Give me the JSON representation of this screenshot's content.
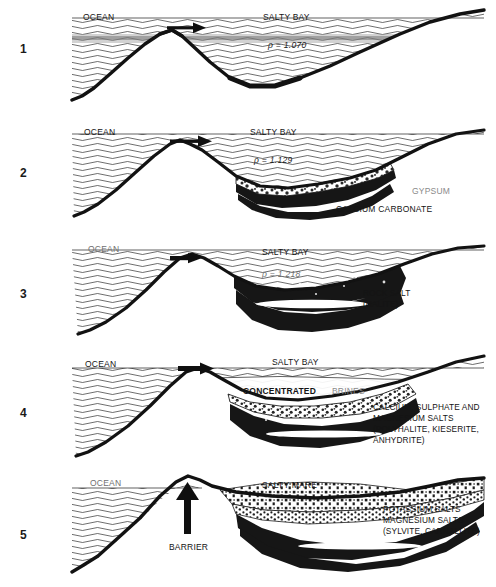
{
  "figure": {
    "title_alt": "Stages of evaporite deposition in a restricted salty bay",
    "caption_partial": ""
  },
  "panels": [
    {
      "number": "1",
      "ocean_label": "OCEAN",
      "basin_label": "SALTY BAY",
      "density_label": "ρ = 1.070",
      "deposit_labels": [],
      "arrow": "flow-arrow-right",
      "barrier_label": null
    },
    {
      "number": "2",
      "ocean_label": "OCEAN",
      "basin_label": "SALTY BAY",
      "density_label": "ρ = 1.129",
      "deposit_labels": [
        {
          "text": "GYPSUM",
          "tone": "gray"
        },
        {
          "text": "CALCIUM  CARBONATE",
          "tone": "dark"
        }
      ],
      "arrow": "flow-arrow-right",
      "barrier_label": null
    },
    {
      "number": "3",
      "ocean_label": "OCEAN",
      "basin_label": "SALTY BAY",
      "density_label": "ρ = 1.218",
      "deposit_labels": [
        {
          "text": "ROCK SALT\n(HALITE)",
          "tone": "dark"
        }
      ],
      "arrow": "flow-arrow-right",
      "barrier_label": null
    },
    {
      "number": "4",
      "ocean_label": "OCEAN",
      "basin_label": "SALTY BAY",
      "density_label": null,
      "brine_label_dark": "CONCENTRATED",
      "brine_label_gray": "BRINES",
      "deposit_labels": [
        {
          "text": "CALCIUM, SULPHATE AND\nMAGNESIUM SALTS\n(POLYHALITE, KIESERITE,\n    ANHYDRITE)",
          "tone": "dark"
        }
      ],
      "arrow": "flow-arrow-right",
      "barrier_label": null
    },
    {
      "number": "5",
      "ocean_label": "OCEAN",
      "basin_label": "SALTY MARE",
      "density_label": null,
      "deposit_labels": [
        {
          "text": "POTASSIUM SALTS\nMAGNESIUM SALTS\n(SYLVITE, CARNALLITE)",
          "tone": "dark"
        }
      ],
      "arrow": "barrier-arrow-up",
      "barrier_label": "BARRIER"
    }
  ],
  "colors": {
    "ink": "#141414",
    "gray_label": "#8a8a8a",
    "background": "#ffffff"
  }
}
